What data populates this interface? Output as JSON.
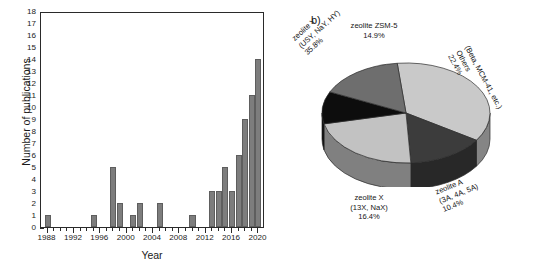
{
  "figure": {
    "panel_a_label": "a)",
    "panel_b_label": "b)"
  },
  "chart_data": [
    {
      "type": "bar",
      "panel": "a",
      "title": "",
      "xlabel": "Year",
      "ylabel": "Number of publications",
      "xlim": [
        1987,
        2021
      ],
      "ylim": [
        0,
        18
      ],
      "ytick_step": 1,
      "xtick_labels": [
        "1988",
        "1992",
        "1996",
        "2000",
        "2004",
        "2008",
        "2012",
        "2016",
        "2020"
      ],
      "ytick_labels": [
        "0",
        "1",
        "2",
        "3",
        "4",
        "5",
        "6",
        "7",
        "8",
        "9",
        "10",
        "11",
        "12",
        "13",
        "14",
        "15",
        "16",
        "17",
        "18"
      ],
      "grid": false,
      "legend": "none",
      "bar_color": "#7d7d7d",
      "categories": [
        1988,
        1989,
        1990,
        1991,
        1992,
        1993,
        1994,
        1995,
        1996,
        1997,
        1998,
        1999,
        2000,
        2001,
        2002,
        2003,
        2004,
        2005,
        2006,
        2007,
        2008,
        2009,
        2010,
        2011,
        2012,
        2013,
        2014,
        2015,
        2016,
        2017,
        2018,
        2019,
        2020
      ],
      "values": [
        1,
        0,
        0,
        0,
        0,
        0,
        0,
        1,
        0,
        0,
        5,
        2,
        0,
        1,
        2,
        0,
        0,
        2,
        0,
        0,
        0,
        0,
        1,
        0,
        0,
        3,
        3,
        5,
        3,
        6,
        9,
        11,
        14
      ]
    },
    {
      "type": "pie",
      "panel": "b",
      "title": "",
      "legend": "labels-around-slices",
      "total_label": "",
      "slices": [
        {
          "name": "zeolite Y",
          "detail": "(USY, NaY, HY)",
          "value": 35.8,
          "value_label": "35.8%",
          "color": "#c9c9c9"
        },
        {
          "name": "zeolite ZSM-5",
          "detail": "",
          "value": 14.9,
          "value_label": "14.9%",
          "color": "#3c3c3c"
        },
        {
          "name": "Others",
          "detail": "(Beta, MCM-41, etc.)",
          "value": 22.4,
          "value_label": "22.4%",
          "color": "#c2c2c2"
        },
        {
          "name": "zeolite A",
          "detail": "(3A, 4A, 5A)",
          "value": 10.4,
          "value_label": "10.4%",
          "color": "#0d0d0d"
        },
        {
          "name": "zeolite X",
          "detail": "(13X, NaX)",
          "value": 16.4,
          "value_label": "16.4%",
          "color": "#6e6e6e"
        }
      ]
    }
  ]
}
